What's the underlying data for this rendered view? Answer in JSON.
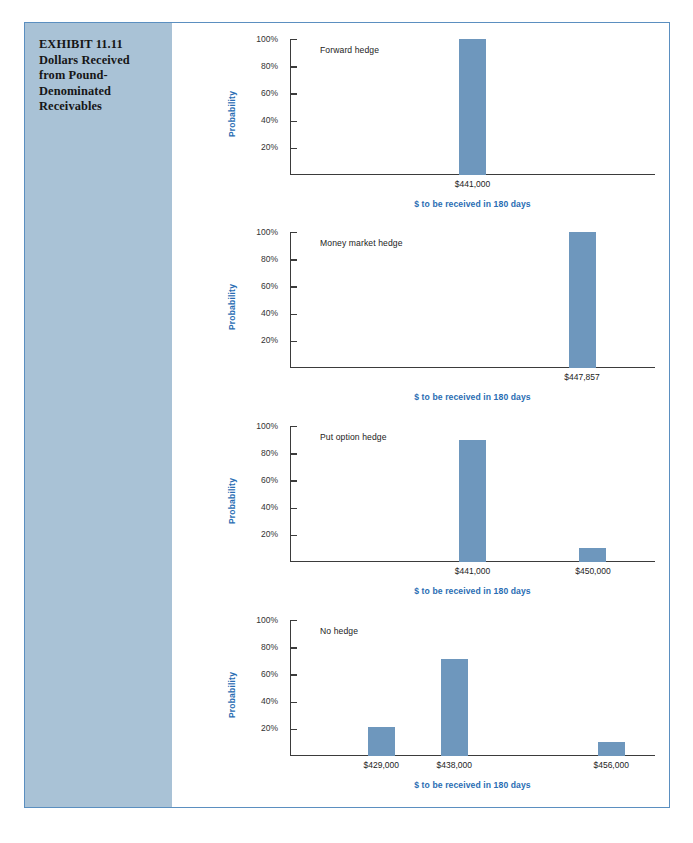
{
  "exhibit": {
    "caption": "EXHIBIT 11.11\nDollars Received\nfrom Pound-\nDenominated\nReceivables",
    "frame_border_color": "#5b8fc0",
    "caption_panel_color": "#a9c2d6"
  },
  "style": {
    "bar_color": "#6e97bd",
    "axis_color": "#3b3b3b",
    "axis_title_color": "#2a6db3",
    "tick_label_color": "#333333"
  },
  "chart_data": [
    {
      "type": "bar",
      "title": "Forward hedge",
      "xlabel": "$ to be received in 180 days",
      "ylabel": "Probability",
      "ylim": [
        0,
        100
      ],
      "yticks": [
        "20%",
        "40%",
        "60%",
        "80%",
        "100%"
      ],
      "grid": false,
      "legend": "none",
      "categories": [
        "$441,000"
      ],
      "values": [
        100
      ],
      "positions_pct": [
        50
      ]
    },
    {
      "type": "bar",
      "title": "Money market hedge",
      "xlabel": "$ to be received in 180 days",
      "ylabel": "Probability",
      "ylim": [
        0,
        100
      ],
      "yticks": [
        "20%",
        "40%",
        "60%",
        "80%",
        "100%"
      ],
      "grid": false,
      "legend": "none",
      "categories": [
        "$447,857"
      ],
      "values": [
        100
      ],
      "positions_pct": [
        80
      ]
    },
    {
      "type": "bar",
      "title": "Put option hedge",
      "xlabel": "$ to be received in 180 days",
      "ylabel": "Probability",
      "ylim": [
        0,
        100
      ],
      "yticks": [
        "20%",
        "40%",
        "60%",
        "80%",
        "100%"
      ],
      "grid": false,
      "legend": "none",
      "categories": [
        "$441,000",
        "$450,000"
      ],
      "values": [
        90,
        10
      ],
      "positions_pct": [
        50,
        83
      ]
    },
    {
      "type": "bar",
      "title": "No hedge",
      "xlabel": "$ to be received in 180 days",
      "ylabel": "Probability",
      "ylim": [
        0,
        100
      ],
      "yticks": [
        "20%",
        "40%",
        "60%",
        "80%",
        "100%"
      ],
      "grid": false,
      "legend": "none",
      "categories": [
        "$429,000",
        "$438,000",
        "$456,000"
      ],
      "values": [
        21,
        71,
        10
      ],
      "positions_pct": [
        25,
        45,
        88
      ]
    }
  ]
}
